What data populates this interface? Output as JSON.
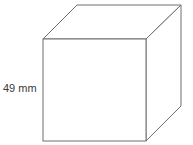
{
  "diagram": {
    "type": "cube",
    "dimension_label": "49 mm",
    "edge_color": "#6e6e6e",
    "label_color": "#3a3a3a"
  }
}
